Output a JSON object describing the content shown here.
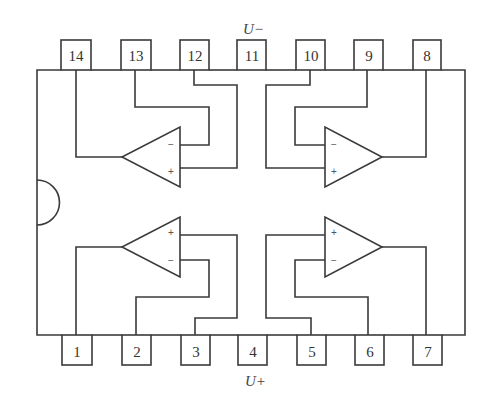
{
  "diagram": {
    "supply_labels": {
      "negative": "U−",
      "positive": "U+"
    },
    "pins_top": [
      {
        "number": "14",
        "x": 61
      },
      {
        "number": "13",
        "x": 121
      },
      {
        "number": "12",
        "x": 180
      },
      {
        "number": "11",
        "x": 237
      },
      {
        "number": "10",
        "x": 296
      },
      {
        "number": "9",
        "x": 354
      },
      {
        "number": "8",
        "x": 413
      }
    ],
    "pins_bottom": [
      {
        "number": "1",
        "x": 62
      },
      {
        "number": "2",
        "x": 122
      },
      {
        "number": "3",
        "x": 181
      },
      {
        "number": "4",
        "x": 238
      },
      {
        "number": "5",
        "x": 297
      },
      {
        "number": "6",
        "x": 355
      },
      {
        "number": "7",
        "x": 413
      }
    ],
    "opamps": [
      {
        "id": "top-left",
        "output_pin": "14",
        "inverting_pin": "13",
        "noninverting_pin": "12",
        "minus": "−",
        "plus": "+"
      },
      {
        "id": "top-right",
        "output_pin": "8",
        "inverting_pin": "9",
        "noninverting_pin": "10",
        "minus": "−",
        "plus": "+"
      },
      {
        "id": "bottom-left",
        "output_pin": "1",
        "inverting_pin": "2",
        "noninverting_pin": "3",
        "minus": "−",
        "plus": "+"
      },
      {
        "id": "bottom-right",
        "output_pin": "7",
        "inverting_pin": "6",
        "noninverting_pin": "5",
        "minus": "−",
        "plus": "+"
      }
    ],
    "colors": {
      "line": "#3a3a3a",
      "background": "#ffffff"
    }
  }
}
